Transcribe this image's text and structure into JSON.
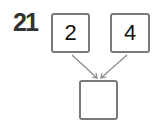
{
  "problem": {
    "number": "21",
    "inputs": [
      {
        "value": "2"
      },
      {
        "value": "4"
      }
    ],
    "result": {
      "value": ""
    },
    "colors": {
      "border": "#7a7a7a",
      "arrow": "#8a8a8a",
      "number": "#333333"
    }
  }
}
